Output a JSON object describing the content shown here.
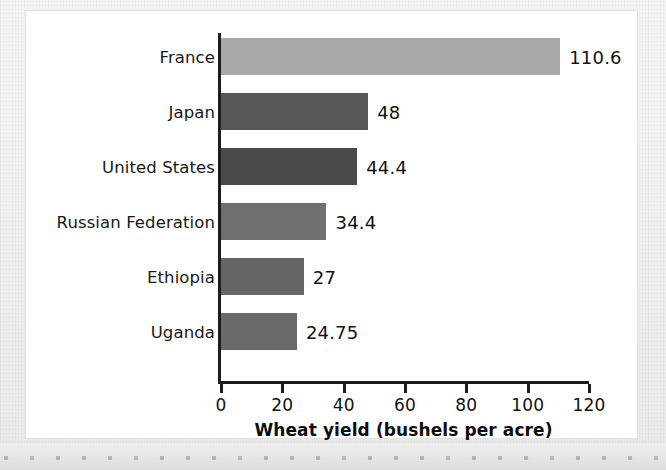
{
  "chart_data": {
    "type": "bar",
    "orientation": "horizontal",
    "title": "",
    "xlabel": "Wheat yield (bushels per acre)",
    "ylabel": "",
    "xlim": [
      0,
      120
    ],
    "xticks": [
      0,
      20,
      40,
      60,
      80,
      100,
      120
    ],
    "xtick_labels": [
      "0",
      "20",
      "40",
      "60",
      "80",
      "100",
      "120"
    ],
    "grid": false,
    "legend": "none",
    "categories": [
      "France",
      "Japan",
      "United States",
      "Russian Federation",
      "Ethiopia",
      "Uganda"
    ],
    "values": [
      110.6,
      48,
      44.4,
      34.4,
      27,
      24.75
    ],
    "value_labels": [
      "110.6",
      "48",
      "44.4",
      "34.4",
      "27",
      "24.75"
    ],
    "bar_colors": [
      "#a9a9a9",
      "#575757",
      "#4b4b4b",
      "#6f6f6f",
      "#656565",
      "#6a6a6a"
    ],
    "bars": [
      {
        "category": "France",
        "value": 110.6,
        "label": "110.6",
        "color": "#a9a9a9"
      },
      {
        "category": "Japan",
        "value": 48,
        "label": "48",
        "color": "#575757"
      },
      {
        "category": "United States",
        "value": 44.4,
        "label": "44.4",
        "color": "#4b4b4b"
      },
      {
        "category": "Russian Federation",
        "value": 34.4,
        "label": "34.4",
        "color": "#6f6f6f"
      },
      {
        "category": "Ethiopia",
        "value": 27,
        "label": "27",
        "color": "#656565"
      },
      {
        "category": "Uganda",
        "value": 24.75,
        "label": "24.75",
        "color": "#6a6a6a"
      }
    ],
    "axis_color": "#1d1d1d"
  }
}
